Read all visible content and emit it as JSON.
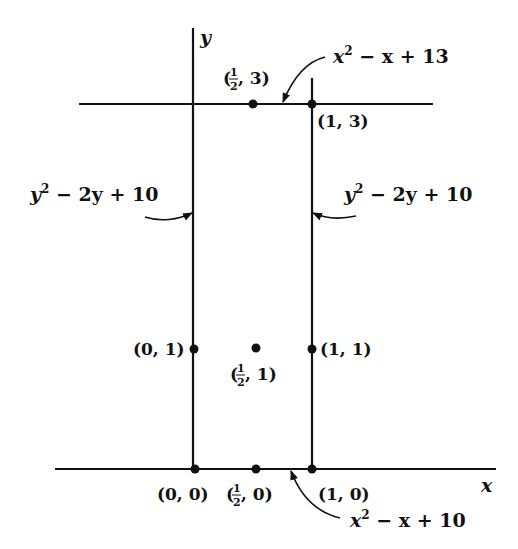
{
  "diagram": {
    "axes": {
      "x_label": "x",
      "y_label": "y"
    },
    "points": [
      {
        "id": "p00",
        "label_a": "(0, 0)",
        "coords": [
          0,
          0
        ]
      },
      {
        "id": "p_half_0",
        "label_pre": "(",
        "label_frac_num": "1",
        "label_frac_den": "2",
        "label_post": ", 0)",
        "coords": [
          0.5,
          0
        ]
      },
      {
        "id": "p10",
        "label_a": "(1, 0)",
        "coords": [
          1,
          0
        ]
      },
      {
        "id": "p01",
        "label_a": "(0, 1)",
        "coords": [
          0,
          1
        ]
      },
      {
        "id": "p_half_1",
        "label_pre": "(",
        "label_frac_num": "1",
        "label_frac_den": "2",
        "label_post": ", 1)",
        "coords": [
          0.5,
          1
        ]
      },
      {
        "id": "p11",
        "label_a": "(1, 1)",
        "coords": [
          1,
          1
        ]
      },
      {
        "id": "p_half_3",
        "label_pre": "(",
        "label_frac_num": "1",
        "label_frac_den": "2",
        "label_post": ", 3)",
        "coords": [
          0.5,
          3
        ]
      },
      {
        "id": "p13",
        "label_a": "(1, 3)",
        "coords": [
          1,
          3
        ]
      }
    ],
    "edge_labels": {
      "top": {
        "base": "x",
        "sup": "2",
        "rest": " − x + 13"
      },
      "bottom": {
        "base": "x",
        "sup": "2",
        "rest": " − x + 10"
      },
      "left": {
        "base": "y",
        "sup": "2",
        "rest": " − 2y + 10"
      },
      "right": {
        "base": "y",
        "sup": "2",
        "rest": " − 2y + 10"
      }
    }
  }
}
